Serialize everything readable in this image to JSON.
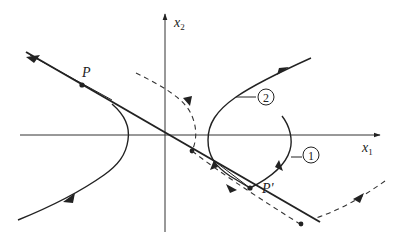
{
  "figure": {
    "type": "phase-plane",
    "axes": {
      "horizontal": {
        "label": "x",
        "subscript": "1"
      },
      "vertical": {
        "label": "x",
        "subscript": "2"
      }
    },
    "points": [
      {
        "id": "P",
        "label": "P"
      },
      {
        "id": "P_prime",
        "label": "P'"
      }
    ],
    "curve_labels": [
      {
        "id": "curve-1",
        "label": "1"
      },
      {
        "id": "curve-2",
        "label": "2"
      }
    ],
    "colors": {
      "ink": "#222222",
      "background": "#ffffff"
    }
  }
}
